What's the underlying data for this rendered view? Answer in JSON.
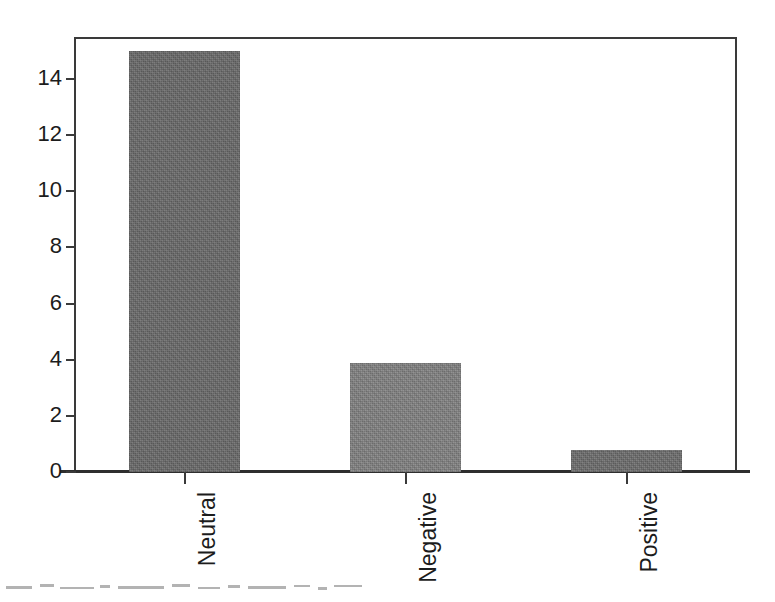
{
  "chart_data": {
    "type": "bar",
    "title": "",
    "subtitle": "",
    "xlabel": "",
    "ylabel": "",
    "categories": [
      "Neutral",
      "Negative",
      "Positive"
    ],
    "values": [
      15,
      3.9,
      0.8
    ],
    "series": [
      {
        "name": "Count",
        "values": [
          15,
          3.9,
          0.8
        ]
      }
    ],
    "ylim": [
      0,
      15.5
    ],
    "xlim": [
      0,
      3
    ],
    "yticks": [
      0,
      2,
      4,
      6,
      8,
      10,
      12,
      14
    ],
    "ytick_labels": [
      "0",
      "2",
      "4",
      "6",
      "8",
      "10",
      "12",
      "14"
    ],
    "xtick_labels": [
      "Neutral",
      "Negative",
      "Positive"
    ],
    "xtick_label_rotation": 90,
    "grid": false,
    "legend": false,
    "legend_position": "none",
    "annotations": [],
    "bar_colors": [
      "#6a6a6a",
      "#828282",
      "#6e6e6e"
    ],
    "bar_edge_color": "#4a4a4a",
    "axis_color": "#3a3a3a",
    "background_color": "#ffffff",
    "text_color": "#1c1c1c"
  },
  "axes": {
    "y": {
      "name": "y-axis",
      "ticks": [
        {
          "label": "0",
          "value": 0
        },
        {
          "label": "2",
          "value": 2
        },
        {
          "label": "4",
          "value": 4
        },
        {
          "label": "6",
          "value": 6
        },
        {
          "label": "8",
          "value": 8
        },
        {
          "label": "10",
          "value": 10
        },
        {
          "label": "12",
          "value": 12
        },
        {
          "label": "14",
          "value": 14
        }
      ]
    },
    "x": {
      "name": "x-axis",
      "ticks": [
        {
          "label": "Neutral",
          "value": 15
        },
        {
          "label": "Negative",
          "value": 3.9
        },
        {
          "label": "Positive",
          "value": 0.8
        }
      ]
    }
  }
}
